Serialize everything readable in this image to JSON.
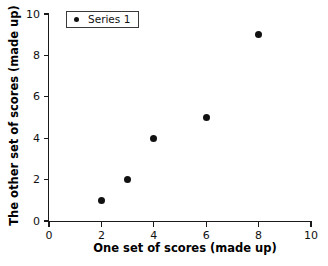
{
  "chart_data": {
    "type": "scatter",
    "title": "",
    "xlabel": "One set of scores (made up)",
    "ylabel": "The other set of scores (made up)",
    "xlim": [
      0,
      10
    ],
    "ylim": [
      0,
      10
    ],
    "xticks": [
      "0",
      "2",
      "4",
      "6",
      "8",
      "10"
    ],
    "yticks": [
      "0",
      "2",
      "4",
      "6",
      "8",
      "10"
    ],
    "xtick_values": [
      0,
      2,
      4,
      6,
      8,
      10
    ],
    "ytick_values": [
      0,
      2,
      4,
      6,
      8,
      10
    ],
    "grid": false,
    "legend_position": "top-left-inside",
    "series": [
      {
        "name": "Series 1",
        "marker": "filled-circle",
        "color": "#111111",
        "points": [
          {
            "x": 2,
            "y": 1
          },
          {
            "x": 3,
            "y": 2
          },
          {
            "x": 4,
            "y": 4
          },
          {
            "x": 6,
            "y": 5
          },
          {
            "x": 8,
            "y": 9
          }
        ]
      }
    ]
  },
  "legend": {
    "entries": [
      {
        "label": "Series 1",
        "marker_color": "#111111"
      }
    ]
  },
  "colors": {
    "axis": "#1a1a1a",
    "marker": "#111111",
    "background": "#ffffff",
    "legend_border": "#3a3a3a"
  }
}
